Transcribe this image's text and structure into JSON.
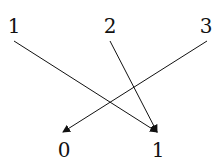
{
  "diagram": {
    "type": "mapping",
    "top_nodes": [
      {
        "label": "1",
        "x": 14,
        "y": 26
      },
      {
        "label": "2",
        "x": 110,
        "y": 26
      },
      {
        "label": "3",
        "x": 206,
        "y": 26
      }
    ],
    "bottom_nodes": [
      {
        "label": "0",
        "x": 64,
        "y": 150
      },
      {
        "label": "1",
        "x": 158,
        "y": 150
      }
    ],
    "edges": [
      {
        "from": "1",
        "to": "1",
        "x1": 14,
        "y1": 41,
        "x2": 157,
        "y2": 132
      },
      {
        "from": "2",
        "to": "1",
        "x1": 110,
        "y1": 41,
        "x2": 157,
        "y2": 132
      },
      {
        "from": "3",
        "to": "0",
        "x1": 207,
        "y1": 41,
        "x2": 63,
        "y2": 132
      }
    ],
    "color": "#111111"
  }
}
